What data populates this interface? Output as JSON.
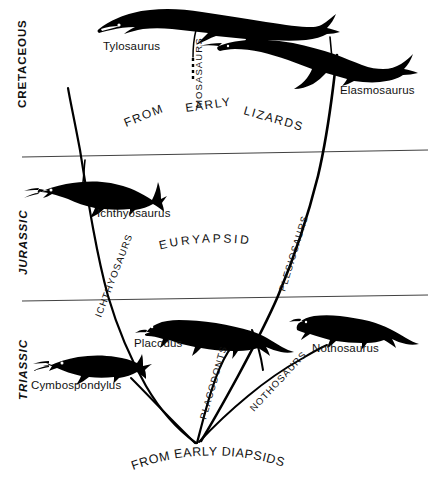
{
  "figure": {
    "background_color": "#ffffff",
    "ink_color": "#000000"
  },
  "eras": [
    {
      "id": "cretaceous",
      "label": "CRETACEOUS",
      "style": "upright-bold"
    },
    {
      "id": "jurassic",
      "label": "JURASSIC",
      "style": "italic-bold"
    },
    {
      "id": "triassic",
      "label": "TRIASSIC",
      "style": "italic-bold"
    }
  ],
  "dividers": [
    {
      "id": "cretaceous-jurassic-divider"
    },
    {
      "id": "jurassic-triassic-divider"
    }
  ],
  "species": [
    {
      "id": "tylosaurus",
      "label": "Tylosaurus"
    },
    {
      "id": "elasmosaurus",
      "label": "Elasmosaurus"
    },
    {
      "id": "ichthyosaurus",
      "label": "Ichthyosaurus"
    },
    {
      "id": "placodus",
      "label": "Placodus"
    },
    {
      "id": "nothosaurus",
      "label": "Nothosaurus"
    },
    {
      "id": "cymbospondylus",
      "label": "Cymbospondylus"
    }
  ],
  "branch_labels": [
    {
      "id": "mosasaurs",
      "label": "MOSASAURS"
    },
    {
      "id": "plesiosaurs",
      "label": "PLESIOSAURS"
    },
    {
      "id": "ichthyosaurs",
      "label": "ICHTHYOSAURS"
    },
    {
      "id": "placodonts",
      "label": "PLACODONTS"
    },
    {
      "id": "nothosaurs",
      "label": "NOTHOSAURS"
    }
  ],
  "group_labels": [
    {
      "id": "euryapsida",
      "label": "EURYAPSIDA"
    }
  ],
  "arc_labels": [
    {
      "id": "from-early-lizards",
      "words": [
        "FROM",
        "EARLY",
        "LIZARDS"
      ],
      "full": "FROM EARLY LIZARDS"
    }
  ],
  "origin_label": {
    "id": "from-early-diapsids",
    "label": "FROM EARLY DIAPSIDS"
  }
}
